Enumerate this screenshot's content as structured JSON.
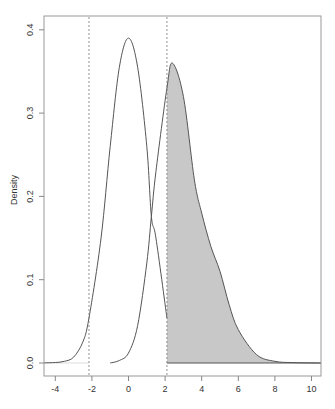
{
  "chart_data": {
    "type": "line",
    "title": "",
    "xlabel": "",
    "ylabel": "Density",
    "xlim": [
      -4.6,
      10.6
    ],
    "ylim": [
      -0.016,
      0.42
    ],
    "x_ticks": [
      -4,
      -2,
      0,
      2,
      4,
      6,
      8,
      10
    ],
    "x_tick_labels": [
      "-4",
      "-2",
      "0",
      "2",
      "4",
      "6",
      "8",
      "10"
    ],
    "y_ticks": [
      0.0,
      0.1,
      0.2,
      0.3,
      0.4
    ],
    "y_tick_labels": [
      "0.0",
      "0.1",
      "0.2",
      "0.3",
      "0.4"
    ],
    "grid": false,
    "legend": null,
    "reference_lines": [
      {
        "orientation": "vertical",
        "x": -2.16,
        "style": "dashed"
      },
      {
        "orientation": "vertical",
        "x": 2.1,
        "style": "dashed"
      }
    ],
    "series": [
      {
        "name": "null-distribution",
        "description": "Symmetric bell curve centered at 0",
        "x": [
          -4.6,
          -4.0,
          -3.5,
          -3.0,
          -2.5,
          -2.16,
          -1.5,
          -1.0,
          -0.5,
          0.0,
          0.5,
          1.0,
          1.25,
          1.5,
          2.1
        ],
        "values": [
          0.0002,
          0.0006,
          0.002,
          0.007,
          0.025,
          0.054,
          0.15,
          0.26,
          0.355,
          0.39,
          0.355,
          0.26,
          0.176,
          0.15,
          0.054
        ],
        "fill": "none"
      },
      {
        "name": "alternative-distribution",
        "description": "Right-skewed curve peaking near 2.4, shaded right of 2.1",
        "x": [
          -1.0,
          -0.5,
          0.0,
          0.5,
          1.0,
          1.25,
          1.5,
          2.1,
          2.4,
          3.0,
          3.6,
          4.0,
          4.5,
          5.0,
          5.5,
          6.0,
          7.0,
          8.0,
          9.0,
          10.5
        ],
        "values": [
          0.0,
          0.003,
          0.012,
          0.045,
          0.12,
          0.176,
          0.23,
          0.33,
          0.36,
          0.32,
          0.22,
          0.18,
          0.14,
          0.11,
          0.07,
          0.04,
          0.01,
          0.002,
          0.0005,
          0.0
        ],
        "fill": "shaded from x=2.1 to right"
      }
    ],
    "shaded_region": {
      "from": 2.1,
      "to": 10.5,
      "series": "alternative-distribution",
      "color": "#c8c8c8"
    }
  },
  "colors": {
    "curve": "#555555",
    "shade": "#c8c8c8",
    "axis": "#888888",
    "dashed": "#777777"
  }
}
